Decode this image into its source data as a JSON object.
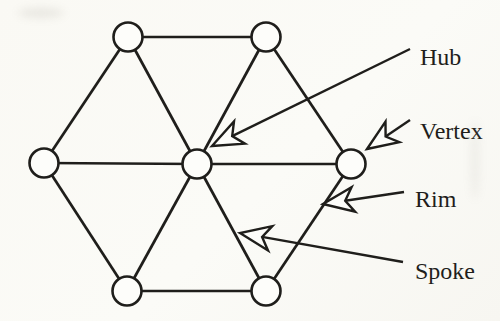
{
  "figure": {
    "width": 500,
    "height": 321,
    "colors": {
      "background": "#fbfaf6",
      "ink": "#1f1e1b",
      "node_fill": "#fdfdfa"
    },
    "style": {
      "node_radius": 14.5,
      "edge_width": 2.7,
      "node_stroke_width": 2.6,
      "leader_width": 2.4,
      "dart_length": 33,
      "dart_half_angle_deg": 22,
      "dart_notch_ratio": 0.68
    },
    "nodes": {
      "hub": {
        "x": 197,
        "y": 164
      },
      "top_left": {
        "x": 128,
        "y": 37
      },
      "top_right": {
        "x": 266,
        "y": 37
      },
      "right": {
        "x": 351,
        "y": 164
      },
      "bottom_right": {
        "x": 266,
        "y": 291
      },
      "bottom_left": {
        "x": 127,
        "y": 291
      },
      "left": {
        "x": 44,
        "y": 163
      }
    },
    "rim_edges": [
      [
        "top_left",
        "top_right"
      ],
      [
        "top_right",
        "right"
      ],
      [
        "right",
        "bottom_right"
      ],
      [
        "bottom_right",
        "bottom_left"
      ],
      [
        "bottom_left",
        "left"
      ],
      [
        "left",
        "top_left"
      ]
    ],
    "spoke_edges": [
      [
        "hub",
        "top_left"
      ],
      [
        "hub",
        "top_right"
      ],
      [
        "hub",
        "right"
      ],
      [
        "hub",
        "bottom_right"
      ],
      [
        "hub",
        "bottom_left"
      ],
      [
        "hub",
        "left"
      ]
    ],
    "callouts": [
      {
        "label": "Hub",
        "text_x": 420,
        "text_y": 57,
        "tail": [
          410,
          49
        ],
        "tip": [
          212,
          146
        ]
      },
      {
        "label": "Vertex",
        "text_x": 420,
        "text_y": 131,
        "tail": [
          410,
          120
        ],
        "tip": [
          367,
          149
        ]
      },
      {
        "label": "Rim",
        "text_x": 415,
        "text_y": 199,
        "tail": [
          404,
          192
        ],
        "tip": [
          323,
          204
        ]
      },
      {
        "label": "Spoke",
        "text_x": 415,
        "text_y": 271,
        "tail": [
          403,
          262
        ],
        "tip": [
          240,
          233
        ]
      }
    ]
  }
}
